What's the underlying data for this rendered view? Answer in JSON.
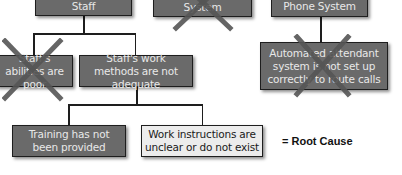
{
  "diagram": {
    "type": "root-cause tree",
    "top_row": [
      {
        "id": "staff",
        "label": "Staff",
        "crossed": false
      },
      {
        "id": "system",
        "label": "System",
        "crossed": true
      },
      {
        "id": "phone-system",
        "label": "Phone System",
        "crossed": false
      }
    ],
    "middle_row": [
      {
        "id": "staff-abilities",
        "label": "Staff's abilities are poor",
        "crossed": true,
        "parent": "staff"
      },
      {
        "id": "staff-work-methods",
        "label": "Staff's work methods are  not adequate",
        "crossed": false,
        "parent": "staff"
      },
      {
        "id": "automated-attendant",
        "label": "Automated attendant system is not set up correctly to route calls",
        "crossed": true,
        "parent": "phone-system"
      }
    ],
    "bottom_row": [
      {
        "id": "training",
        "label": "Training has not been provided",
        "crossed": false,
        "root_cause": false,
        "parent": "staff-work-methods"
      },
      {
        "id": "work-instructions",
        "label": "Work instructions are unclear or do not exist",
        "crossed": false,
        "root_cause": true,
        "parent": "staff-work-methods"
      }
    ],
    "legend": {
      "label": "= Root Cause"
    },
    "colors": {
      "box_fill": "#6a6a6a",
      "box_text": "#e8e8e8",
      "root_cause_fill": "#ececec",
      "root_cause_text": "#1a1a1a",
      "border": "#1e1e1e",
      "cross_mark": "#555555"
    }
  }
}
